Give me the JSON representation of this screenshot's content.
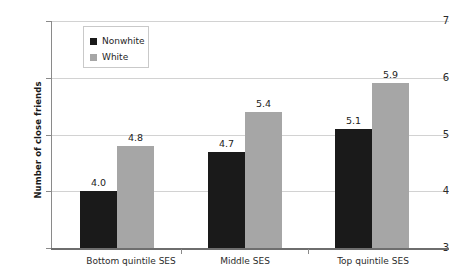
{
  "chart_data": {
    "type": "bar",
    "title": "",
    "subtitle": "",
    "xlabel": "",
    "ylabel": "Number of close friends",
    "categories": [
      "Bottom quintile SES",
      "Middle SES",
      "Top quintile SES"
    ],
    "series": [
      {
        "name": "Nonwhite",
        "color": "#1a1a1a",
        "values": [
          4.0,
          4.7,
          5.1
        ],
        "labels": [
          "4.0",
          "4.7",
          "5.1"
        ]
      },
      {
        "name": "White",
        "color": "#a6a6a6",
        "values": [
          4.8,
          5.4,
          5.9
        ],
        "labels": [
          "4.8",
          "5.4",
          "5.9"
        ]
      }
    ],
    "ylim": [
      3,
      7
    ],
    "yticks": [
      3,
      4,
      5,
      6,
      7
    ],
    "ytick_labels": [
      "3",
      "4",
      "5",
      "6",
      "7"
    ],
    "grid": true,
    "legend_position": "top-left",
    "legend_entries": [
      "Nonwhite",
      "White"
    ]
  },
  "axis": {
    "y_title": "Number of close friends",
    "tick_3": "3",
    "tick_4": "4",
    "tick_5": "5",
    "tick_6": "6",
    "tick_7": "7"
  },
  "legend": {
    "item_0": "Nonwhite",
    "item_1": "White"
  },
  "categories": {
    "cat_0": "Bottom quintile SES",
    "cat_1": "Middle SES",
    "cat_2": "Top quintile SES"
  },
  "values": {
    "g0_nonwhite": "4.0",
    "g0_white": "4.8",
    "g1_nonwhite": "4.7",
    "g1_white": "5.4",
    "g2_nonwhite": "5.1",
    "g2_white": "5.9"
  }
}
